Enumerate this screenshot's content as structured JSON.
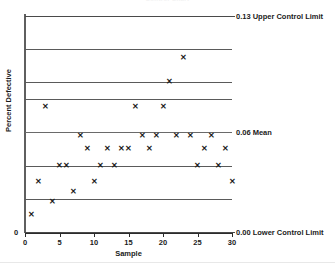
{
  "chart": {
    "title": "Control Chart",
    "xlabel": "Sample",
    "ylabel": "Percent Defective",
    "y_origin_label": "0"
  },
  "annotations": {
    "ucl": "0.13 Upper Control Limit",
    "mean": "0.06 Mean",
    "lcl": "0.00 Lower Control Limit"
  },
  "xticks": [
    "0",
    "5",
    "10",
    "15",
    "20",
    "25",
    "30"
  ],
  "marker_glyph": "✕",
  "colors": {
    "gridline": "#5a5a5a",
    "axis": "#2b2b2b",
    "marker": "#1a1a1a"
  },
  "chart_data": {
    "type": "scatter",
    "title": "Control Chart",
    "xlabel": "Sample",
    "ylabel": "Percent Defective",
    "xlim": [
      0,
      30
    ],
    "ylim": [
      0.0,
      0.14
    ],
    "grid": true,
    "legend": false,
    "xticks": [
      0,
      5,
      10,
      15,
      20,
      25,
      30
    ],
    "gridlines_y": [
      0.13,
      0.11,
      0.09,
      0.08,
      0.06,
      0.04,
      0.02,
      0.0
    ],
    "control_limits": {
      "upper_control_limit": 0.13,
      "mean": 0.06,
      "lower_control_limit": 0.0
    },
    "series": [
      {
        "name": "Percent Defective",
        "marker": "x",
        "x": [
          1,
          2,
          3,
          4,
          5,
          6,
          7,
          8,
          9,
          10,
          11,
          12,
          13,
          14,
          15,
          16,
          17,
          18,
          19,
          20,
          21,
          22,
          23,
          24,
          25,
          26,
          27,
          28,
          29,
          30
        ],
        "values": [
          0.01,
          0.03,
          0.075,
          0.018,
          0.04,
          0.04,
          0.024,
          0.058,
          0.05,
          0.03,
          0.04,
          0.05,
          0.04,
          0.05,
          0.05,
          0.075,
          0.058,
          0.05,
          0.058,
          0.075,
          0.09,
          0.058,
          0.105,
          0.058,
          0.04,
          0.05,
          0.058,
          0.04,
          0.05,
          0.03
        ]
      }
    ]
  }
}
